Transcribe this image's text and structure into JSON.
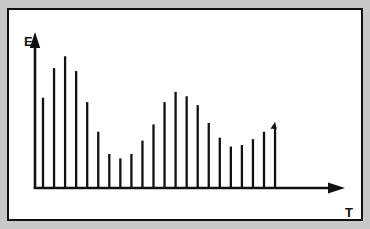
{
  "figure": {
    "background_color": "#c8c8c8",
    "panel_color": "#ffffff",
    "border_color": "#111111",
    "stroke_color": "#111111"
  },
  "axes": {
    "y_label": "E",
    "x_label": "T",
    "y_arrow": "up-arrow",
    "x_arrow": "right-arrow"
  },
  "chart_data": {
    "type": "bar",
    "subtype": "stem-spectrum",
    "title": "",
    "xlabel": "T",
    "ylabel": "E",
    "grid": false,
    "legend": null,
    "axis_ticks": false,
    "axis_tick_labels": false,
    "xlim": [
      0,
      23
    ],
    "ylim": [
      0,
      100
    ],
    "categories": [
      "1",
      "2",
      "3",
      "4",
      "5",
      "6",
      "7",
      "8",
      "9",
      "10",
      "11",
      "12",
      "13",
      "14",
      "15",
      "16",
      "17",
      "18",
      "19",
      "20",
      "21",
      "22",
      "23"
    ],
    "values": [
      61,
      81,
      89,
      79,
      58,
      38,
      23,
      20,
      23,
      32,
      43,
      58,
      65,
      62,
      56,
      44,
      34,
      28,
      29,
      33,
      38,
      42,
      0
    ],
    "annotations": [
      "vertical axis arrow labeled E",
      "horizontal axis arrow labeled T",
      "last stem terminates with a small flag/arrowhead"
    ]
  }
}
